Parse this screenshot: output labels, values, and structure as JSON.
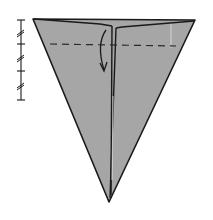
{
  "diagram": {
    "type": "origami-fold-step",
    "colors": {
      "paper": "#a6a6a6",
      "outline": "#1a1a1a",
      "background": "#ffffff",
      "crease_light": "#e0e0e0"
    },
    "shape": {
      "kind": "inverted-triangle",
      "top_left": [
        33,
        19
      ],
      "top_right": [
        195,
        20
      ],
      "apex": [
        109,
        202
      ],
      "center_seam_top": [
        113,
        24
      ]
    },
    "fold_line": {
      "style": "dashed",
      "y": 44,
      "x_start": 50,
      "x_end": 176,
      "meaning": "valley fold"
    },
    "arrow": {
      "direction": "down",
      "meaning": "fold top flap down"
    },
    "scale": {
      "x": 20,
      "y_top": 20,
      "y_bottom": 100,
      "divisions": 3,
      "tick_marks": 4
    }
  }
}
